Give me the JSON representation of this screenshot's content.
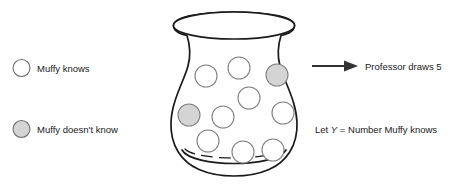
{
  "figure": {
    "background_color": "#ffffff",
    "stroke_color": "#1a1a1a",
    "ball_outline_color": "#808080",
    "ball_known_fill": "#ffffff",
    "ball_unknown_fill": "#d4d4d4"
  },
  "legend": {
    "items": [
      {
        "icon": "empty-circle-icon",
        "label": "Muffy knows",
        "fill": "#ffffff",
        "cx": 21.5,
        "cy": 68,
        "r": 8.5,
        "text_x": 37,
        "text_y": 71.5
      },
      {
        "icon": "filled-circle-icon",
        "label": "Muffy doesn't know",
        "fill": "#d4d4d4",
        "cx": 21.5,
        "cy": 129,
        "r": 8.5,
        "text_x": 37,
        "text_y": 132.5
      }
    ]
  },
  "urn": {
    "name": "urn-jar",
    "outline_path": "M 173.5 25.5 C 173.5 17.8 196.5 12.0 234.0 12.0 C 271.5 12.0 294.5 17.8 294.5 25.5 C 294.5 32.5 283.0 36.5 272.0 37.6 C 276.0 52.0 277.5 62.0 281.5 74.0 C 288.0 93.0 296.5 108.0 297.0 124.0 C 297.5 145.0 286.0 160.0 270.0 167.5 C 258.0 173.2 246.0 175.0 234.0 175.0 C 222.0 175.0 210.0 173.2 198.0 167.5 C 182.0 160.0 170.5 145.0 171.0 124.0 C 171.5 108.0 180.0 93.0 186.5 74.0 C 190.5 62.0 192.0 52.0 196.0 37.6 C 185.0 36.5 173.5 32.5 173.5 25.5 Z",
    "rim_ellipse": {
      "cx": 234,
      "cy": 25.5,
      "rx": 60.5,
      "ry": 13.5
    },
    "base_arc_path": "M 186.0 154.0 C 200.0 167.5 268.0 167.5 282.0 154.0",
    "inner_base_dash_path": "M 184.0 150.0 C 198.0 159.5 270.0 159.5 284.0 150.0"
  },
  "balls": {
    "radius": 11,
    "items": [
      {
        "id": "ball-1",
        "cx": 206,
        "cy": 76,
        "state": "known"
      },
      {
        "id": "ball-2",
        "cx": 239,
        "cy": 68,
        "state": "known"
      },
      {
        "id": "ball-3",
        "cx": 277,
        "cy": 75,
        "state": "unknown"
      },
      {
        "id": "ball-4",
        "cx": 249,
        "cy": 98,
        "state": "known"
      },
      {
        "id": "ball-5",
        "cx": 189,
        "cy": 115,
        "state": "unknown"
      },
      {
        "id": "ball-6",
        "cx": 223,
        "cy": 117,
        "state": "known"
      },
      {
        "id": "ball-7",
        "cx": 283,
        "cy": 113,
        "state": "known"
      },
      {
        "id": "ball-8",
        "cx": 208,
        "cy": 141,
        "state": "known"
      },
      {
        "id": "ball-9",
        "cx": 243,
        "cy": 152,
        "state": "known"
      },
      {
        "id": "ball-10",
        "cx": 273,
        "cy": 150,
        "state": "known"
      }
    ]
  },
  "annotations": {
    "arrow": {
      "name": "draw-arrow",
      "x1": 312,
      "y1": 66,
      "x2": 357,
      "y2": 66,
      "head_points": "357,66 345,61 345,71"
    },
    "draw_label": {
      "text": "Professor draws 5",
      "x": 365,
      "y": 69.5
    },
    "definition_label": {
      "prefix": "Let ",
      "variable": "Y",
      "suffix": " = Number Muffy knows",
      "x": 315,
      "y": 132.5
    }
  }
}
